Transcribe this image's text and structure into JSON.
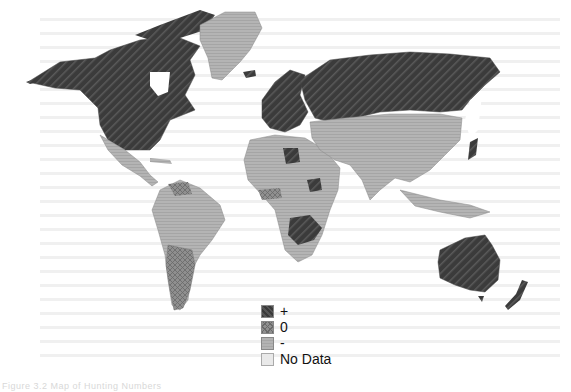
{
  "map": {
    "type": "choropleth-world",
    "legend": {
      "items": [
        {
          "key": "plus",
          "label": "+",
          "fill": "#3d3d3d",
          "pattern": "diagonal-stripes"
        },
        {
          "key": "zero",
          "label": "0",
          "fill": "#8a8a8a",
          "pattern": "crosshatch"
        },
        {
          "key": "minus",
          "label": "-",
          "fill": "#b0b0b0",
          "pattern": "horizontal-lines"
        },
        {
          "key": "nodata",
          "label": "No Data",
          "fill": "#e9e9e9",
          "pattern": "solid"
        }
      ]
    },
    "regions": {
      "plus": [
        "North America (USA, Canada)",
        "Russia",
        "Northern & Western Europe",
        "Australia",
        "New Zealand",
        "Libya",
        "Angola",
        "Zambia",
        "South Sudan",
        "Japan"
      ],
      "zero": [
        "Argentina",
        "Chile",
        "Venezuela",
        "West Africa (part)"
      ],
      "minus": [
        "Greenland",
        "Mexico",
        "Central America",
        "Brazil & most of South America",
        "Most of Africa",
        "Middle East",
        "Central Asia",
        "China",
        "India",
        "Southeast Asia",
        "Indonesia"
      ]
    },
    "caption": "Figure 3.2  Map of Hunting Numbers"
  }
}
